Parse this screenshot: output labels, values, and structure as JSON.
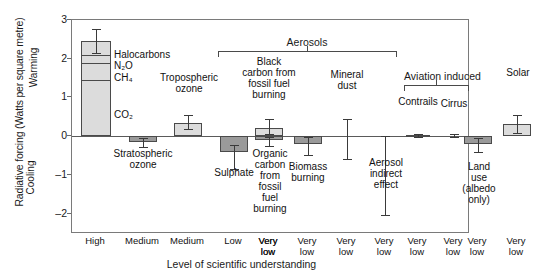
{
  "chart_data": {
    "type": "bar",
    "title": "",
    "ylabel": "Radiative forcing (Watts per square metre)",
    "ylabel_positive_direction": "Warming",
    "ylabel_negative_direction": "Cooling",
    "xlabel": "Level of scientific understanding",
    "ylim": [
      -2.6,
      3.0
    ],
    "yticks": [
      3,
      2,
      1,
      0,
      -1,
      -2
    ],
    "ytick_labels": [
      "3",
      "2",
      "1",
      "0",
      "-1",
      "-2"
    ],
    "grid": false,
    "legend": "none",
    "units": "Watts per square metre",
    "categories": [
      "Greenhouse gases",
      "Stratospheric ozone",
      "Tropospheric ozone",
      "Sulphate",
      "Black carbon from fossil fuel burning",
      "Organic carbon from fossil fuel burning",
      "Biomass burning",
      "Mineral dust",
      "Aerosol indirect effect",
      "Contrails",
      "Cirrus",
      "Land use (albedo only)",
      "Solar"
    ],
    "values": [
      2.45,
      -0.15,
      0.35,
      -0.4,
      0.2,
      -0.1,
      -0.2,
      0.0,
      0.0,
      0.02,
      0.0,
      -0.2,
      0.3
    ],
    "stacked_first_bar": {
      "label": "Greenhouse gases",
      "segments": [
        {
          "name": "CO2",
          "from": 0.0,
          "to": 1.46
        },
        {
          "name": "CH4",
          "from": 1.46,
          "to": 1.9
        },
        {
          "name": "N2O",
          "from": 1.9,
          "to": 2.1
        },
        {
          "name": "Halocarbons",
          "from": 2.1,
          "to": 2.45
        }
      ]
    },
    "error_bars": [
      {
        "category": "Greenhouse gases",
        "low": 2.15,
        "high": 2.78
      },
      {
        "category": "Stratospheric ozone",
        "low": -0.28,
        "high": -0.05
      },
      {
        "category": "Tropospheric ozone",
        "low": 0.18,
        "high": 0.55
      },
      {
        "category": "Sulphate",
        "low": -0.85,
        "high": -0.22
      },
      {
        "category": "Black carbon from fossil fuel burning",
        "low": 0.05,
        "high": 0.45
      },
      {
        "category": "Organic carbon from fossil fuel burning",
        "low": -0.25,
        "high": -0.02
      },
      {
        "category": "Biomass burning",
        "low": -0.5,
        "high": -0.02
      },
      {
        "category": "Mineral dust",
        "low": -0.6,
        "high": 0.45
      },
      {
        "category": "Aerosol indirect effect",
        "low": -2.05,
        "high": 0.0
      },
      {
        "category": "Contrails",
        "low": -0.02,
        "high": 0.06
      },
      {
        "category": "Cirrus",
        "low": -0.02,
        "high": 0.05
      },
      {
        "category": "Land use (albedo only)",
        "low": -0.42,
        "high": -0.05
      },
      {
        "category": "Solar",
        "low": 0.08,
        "high": 0.55
      }
    ],
    "groups": [
      {
        "name": "Aerosols",
        "members": [
          "Sulphate",
          "Black carbon from fossil fuel burning",
          "Organic carbon from fossil fuel burning",
          "Biomass burning",
          "Mineral dust",
          "Aerosol indirect effect"
        ]
      },
      {
        "name": "Aviation induced",
        "members": [
          "Contrails",
          "Cirrus"
        ]
      }
    ],
    "xtick_labels": [
      "High",
      "Medium",
      "Medium",
      "Low",
      "Very\nlow",
      "Very\nlow",
      "Very\nlow",
      "Very\nlow",
      "Very\nlow",
      "Very\nlow",
      "Very\nlow",
      "Very\nlow",
      "Very\nlow"
    ]
  },
  "labels": {
    "halocarbons": "Halocarbons",
    "n2o": "N₂O",
    "ch4": "CH₄",
    "co2": "CO₂",
    "tropospheric_ozone": "Tropospheric\nozone",
    "stratospheric_ozone": "Stratospheric\nozone",
    "aerosols": "Aerosols",
    "black_carbon": "Black\ncarbon from\nfossil fuel\nburning",
    "sulphate": "Sulphate",
    "organic_carbon": "Organic\ncarbon\nfrom\nfossil\nfuel\nburning",
    "biomass_burning": "Biomass\nburning",
    "mineral_dust": "Mineral\ndust",
    "aerosol_indirect": "Aerosol\nindirect\neffect",
    "aviation_induced": "Aviation induced",
    "contrails": "Contrails",
    "cirrus": "Cirrus",
    "land_use": "Land\nuse\n(albedo\nonly)",
    "solar": "Solar"
  },
  "axes": {
    "y_title": "Radiative forcing (Watts per square metre)",
    "warming": "Warming",
    "cooling": "Cooling",
    "x_title": "Level of scientific understanding",
    "yticks": [
      "3",
      "2",
      "1",
      "0",
      "–1",
      "–2"
    ]
  },
  "colors": {
    "bar_light": "#dcdcdc",
    "bar_dark": "#9a9a9a",
    "outline": "#4a4a4a",
    "frame": "#7a7a7a",
    "text": "#111111"
  }
}
